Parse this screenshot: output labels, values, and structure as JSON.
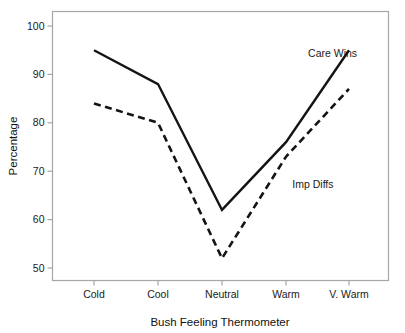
{
  "chart_data": {
    "type": "line",
    "title": "",
    "xlabel": "Bush Feeling Thermometer",
    "ylabel": "Percentage",
    "categories": [
      "Cold",
      "Cool",
      "Neutral",
      "Warm",
      "V. Warm"
    ],
    "ylim": [
      47,
      103
    ],
    "yticks": [
      50,
      60,
      70,
      80,
      90,
      100
    ],
    "ytick_labels": [
      "50",
      "60",
      "70",
      "80",
      "90",
      "100"
    ],
    "grid": false,
    "legend_position": "inline-annotations",
    "series": [
      {
        "name": "Care Wins",
        "style": "solid",
        "values": [
          95,
          88,
          62,
          76,
          95
        ]
      },
      {
        "name": "Imp Diffs",
        "style": "dashed",
        "values": [
          84,
          80,
          52,
          73,
          87
        ]
      }
    ],
    "annotations": [
      {
        "text": "Care Wins",
        "x": 3.35,
        "y": 93.5
      },
      {
        "text": "Imp Diffs",
        "x": 3.1,
        "y": 66.5
      }
    ]
  },
  "axis": {
    "y_title": "Percentage",
    "x_title": "Bush Feeling Thermometer"
  }
}
